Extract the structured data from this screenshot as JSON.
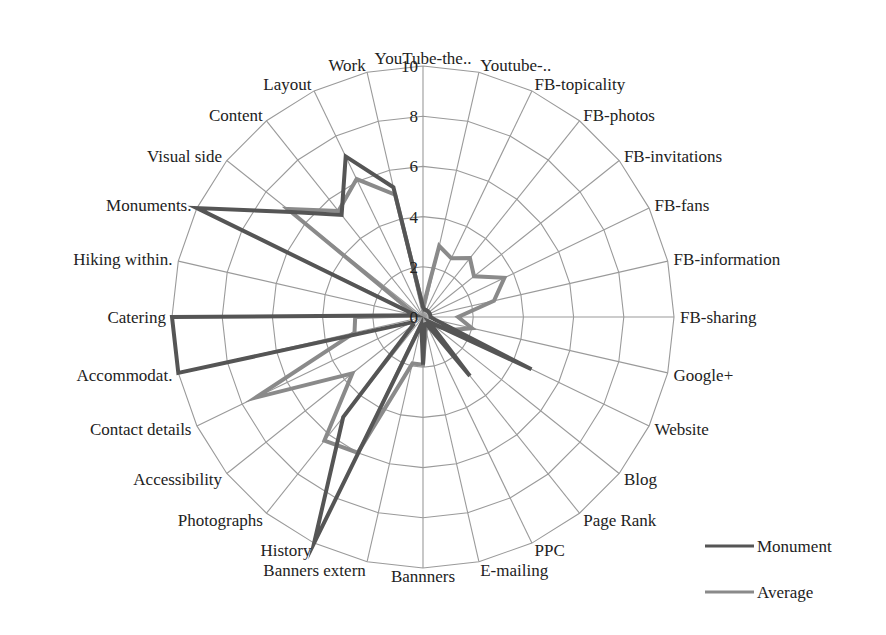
{
  "chart_data": {
    "type": "radar",
    "title": "",
    "categories": [
      "YouTube-the..",
      "Youtube-..",
      "FB-topicality",
      "FB-photos",
      "FB-invitations",
      "FB-fans",
      "FB-information",
      "FB-sharing",
      "Google+",
      "Website",
      "Blog",
      "Page Rank",
      "PPC",
      "E-mailing",
      "Bannners",
      "Banners extern",
      "History",
      "Photographs",
      "Accessibility",
      "Contact details",
      "Accommodat.",
      "Catering",
      "Hiking within.",
      "Monuments.",
      "Visual side",
      "Content",
      "Layout",
      "Work"
    ],
    "series": [
      {
        "name": "Monument",
        "color": "#555555",
        "values": [
          0.4,
          0.3,
          0.3,
          0.3,
          0.3,
          0.3,
          0.3,
          0.3,
          0.5,
          4.8,
          0.3,
          3.0,
          0.3,
          0.3,
          1.9,
          0.3,
          10,
          5.1,
          0.5,
          0.5,
          10,
          10,
          0.3,
          10,
          6.7,
          5.2,
          7.1,
          5.3
        ]
      },
      {
        "name": "Average",
        "color": "#8a8a8a",
        "values": [
          0.4,
          2.9,
          2.6,
          3.0,
          2.6,
          3.6,
          2.9,
          1.4,
          2.0,
          1.2,
          0.5,
          0.5,
          0.5,
          0.5,
          1.9,
          1.9,
          6.0,
          6.3,
          3.6,
          7.4,
          2.8,
          2.7,
          0.3,
          0.5,
          6.9,
          5.4,
          6.1,
          5.0
        ]
      }
    ],
    "rlim": [
      0,
      10
    ],
    "ticks": [
      "0",
      "2",
      "4",
      "6",
      "8",
      "10"
    ],
    "tick_values": [
      0,
      2,
      4,
      6,
      8,
      10
    ],
    "grid": true,
    "grid_color": "#9a9a9a",
    "legend_position": "bottom-right"
  },
  "legend": {
    "items": [
      {
        "label": "Monument",
        "color": "#555555"
      },
      {
        "label": "Average",
        "color": "#8a8a8a"
      }
    ]
  }
}
